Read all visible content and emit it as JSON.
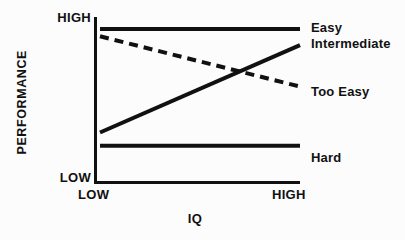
{
  "chart_data": {
    "type": "line",
    "title": "",
    "subtitle": "",
    "xlabel": "IQ",
    "ylabel": "PERFORMANCE",
    "x_tick_labels": [
      "LOW",
      "HIGH"
    ],
    "y_tick_labels": [
      "LOW",
      "HIGH"
    ],
    "xlim": [
      0,
      1
    ],
    "ylim": [
      0,
      1
    ],
    "grid": false,
    "legend_position": "right-of-plot-inline",
    "x": [
      0,
      1
    ],
    "series": [
      {
        "name": "Easy",
        "label": "Easy",
        "values": [
          0.94,
          0.94
        ],
        "style": "solid",
        "color": "#111111"
      },
      {
        "name": "Intermediate",
        "label": "Intermediate",
        "values": [
          0.24,
          0.83
        ],
        "style": "solid",
        "color": "#111111"
      },
      {
        "name": "Too Easy",
        "label": "Too Easy",
        "values": [
          0.89,
          0.55
        ],
        "style": "dashed",
        "color": "#111111"
      },
      {
        "name": "Hard",
        "label": "Hard",
        "values": [
          0.15,
          0.15
        ],
        "style": "solid",
        "color": "#111111"
      }
    ],
    "annotations": [],
    "axis_color": "#111111",
    "background_color": "#fcfcfc"
  },
  "axes": {
    "y_title": "PERFORMANCE",
    "x_title": "IQ",
    "y_tick_high": "HIGH",
    "y_tick_low": "LOW",
    "x_tick_low": "LOW",
    "x_tick_high": "HIGH"
  },
  "legend": {
    "easy": "Easy",
    "intermediate": "Intermediate",
    "too_easy": "Too Easy",
    "hard": "Hard"
  }
}
